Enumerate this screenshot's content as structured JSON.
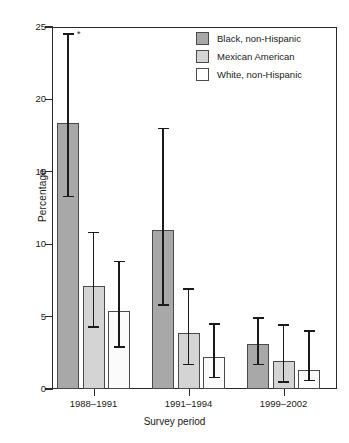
{
  "chart_data": {
    "type": "bar",
    "title": "",
    "xlabel": "Survey period",
    "ylabel": "Percentage",
    "categories": [
      "1988–1991",
      "1991–1994",
      "1999–2002"
    ],
    "ylim": [
      0,
      25
    ],
    "yticks": [
      0,
      5,
      10,
      15,
      20,
      25
    ],
    "ytick_labels": [
      "0",
      "5",
      "10",
      "15",
      "20",
      "25"
    ],
    "grid": false,
    "legend_position": "top-right",
    "error_bars": "95% confidence interval",
    "annotations": [
      {
        "text": "*",
        "series": "Black, non-Hispanic",
        "category": "1988–1991",
        "value": 24.6
      }
    ],
    "series": [
      {
        "name": "Black, non-Hispanic",
        "color": "#a8a8a8",
        "values": [
          18.4,
          11.0,
          3.1
        ],
        "ci_low": [
          13.3,
          5.8,
          1.7
        ],
        "ci_high": [
          24.5,
          18.0,
          4.9
        ]
      },
      {
        "name": "Mexican American",
        "color": "#d4d4d4",
        "values": [
          7.1,
          3.9,
          1.9
        ],
        "ci_low": [
          4.3,
          1.7,
          0.5
        ],
        "ci_high": [
          10.8,
          6.9,
          4.4
        ]
      },
      {
        "name": "White, non-Hispanic",
        "color": "#ffffff",
        "values": [
          5.4,
          2.2,
          1.3
        ],
        "ci_low": [
          2.9,
          0.8,
          0.6
        ],
        "ci_high": [
          8.8,
          4.5,
          4.0
        ]
      }
    ]
  }
}
